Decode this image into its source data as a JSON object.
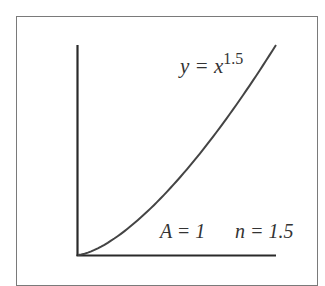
{
  "figure": {
    "curve_label": {
      "base": "y = x",
      "exponent": "1.5"
    },
    "params_label": {
      "a": "A = 1",
      "n": "n = 1.5"
    },
    "colors": {
      "curve": "#444444",
      "axes": "#2a2a2a",
      "frame": "#7a7a7a",
      "text": "#333333"
    }
  },
  "chart_data": {
    "type": "line",
    "title": "",
    "xlabel": "",
    "ylabel": "",
    "series": [
      {
        "name": "y = x^1.5",
        "x": [
          0,
          0.1,
          0.2,
          0.3,
          0.4,
          0.5,
          0.6,
          0.7,
          0.8,
          0.9,
          1.0
        ],
        "values": [
          0,
          0.0316,
          0.0894,
          0.1643,
          0.253,
          0.3536,
          0.4648,
          0.5857,
          0.7155,
          0.8538,
          1.0
        ]
      }
    ],
    "annotations": [
      "y = x^1.5",
      "A = 1",
      "n = 1.5"
    ],
    "grid": false,
    "ticks": false
  }
}
